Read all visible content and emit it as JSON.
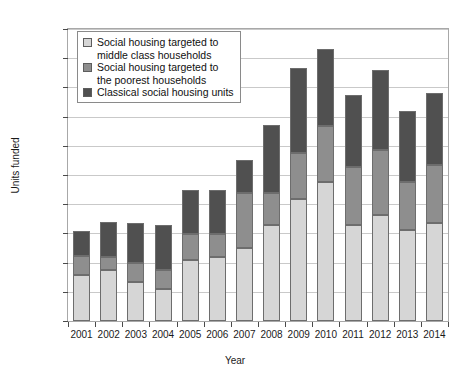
{
  "chart_data": {
    "type": "bar",
    "subtype": "stacked-vertical",
    "title": "",
    "xlabel": "Year",
    "ylabel": "Units funded",
    "categories": [
      "2001",
      "2002",
      "2003",
      "2004",
      "2005",
      "2006",
      "2007",
      "2008",
      "2009",
      "2010",
      "2011",
      "2012",
      "2013",
      "2014"
    ],
    "series": [
      {
        "name": "Classical social housing units",
        "color": "#505050",
        "values": [
          780,
          880,
          665,
          550,
          1050,
          1100,
          1255,
          1640,
          2090,
          2380,
          1640,
          1810,
          1560,
          1680
        ]
      },
      {
        "name": "Social housing targeted to the poorest households",
        "color": "#8e8e8e",
        "values": [
          325,
          220,
          325,
          330,
          435,
          385,
          945,
          560,
          780,
          965,
          1000,
          1110,
          820,
          1000
        ]
      },
      {
        "name": "Social housing targeted to middle class households",
        "color": "#d6d6d6",
        "values": [
          435,
          600,
          690,
          765,
          755,
          755,
          550,
          1155,
          1465,
          1305,
          1225,
          1385,
          1215,
          1225
        ]
      }
    ],
    "totals": [
      1540,
      1700,
      1680,
      1645,
      2240,
      2240,
      2750,
      3355,
      4335,
      4650,
      3865,
      4305,
      3595,
      3905
    ],
    "ylim": [
      0,
      5000
    ],
    "yticks": [
      0,
      500,
      1000,
      1500,
      2000,
      2500,
      3000,
      3500,
      4000,
      4500,
      5000
    ],
    "ytick_labels": [
      "0",
      "500",
      "1,000",
      "1,500",
      "2,000",
      "2,500",
      "3,000",
      "3,500",
      "4,000",
      "4,500",
      "5,000"
    ],
    "grid": true,
    "legend_position": "top-left",
    "legend_entries": [
      {
        "label": "Social housing targeted to\nmiddle class households",
        "color": "#d6d6d6"
      },
      {
        "label": "Social housing targeted to\nthe poorest households",
        "color": "#8e8e8e"
      },
      {
        "label": "Classical social housing units",
        "color": "#505050"
      }
    ]
  }
}
